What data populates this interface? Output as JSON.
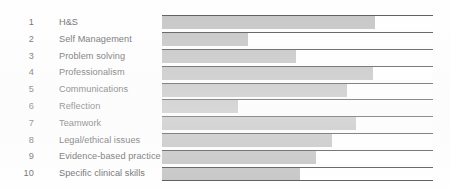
{
  "chart_data": {
    "type": "bar",
    "orientation": "horizontal",
    "title": "",
    "xlabel": "",
    "ylabel": "",
    "grid": false,
    "legend": null,
    "xlim": [
      0,
      100
    ],
    "value_unit": "percent-of-track",
    "categories": [
      "H&S",
      "Self Management",
      "Problem solving",
      "Professionalism",
      "Communications",
      "Reflection",
      "Teamwork",
      "Legal/ethical issues",
      "Evidence-based practice",
      "Specific clinical skills"
    ],
    "row_numbers": [
      "1",
      "2",
      "3",
      "4",
      "5",
      "6",
      "7",
      "8",
      "9",
      "10"
    ],
    "values": [
      78.6,
      31.7,
      49.4,
      77.9,
      68.3,
      28.0,
      71.6,
      62.7,
      56.8,
      50.9
    ],
    "series": [
      {
        "name": "Completion",
        "values": [
          78.6,
          31.7,
          49.4,
          77.9,
          68.3,
          28.0,
          71.6,
          62.7,
          56.8,
          50.9
        ]
      }
    ],
    "colors": {
      "bar_fill": "#c6c6c6",
      "track_fill": "#ffffff",
      "rule": "#5b5b5b",
      "text": "#6f6f6f",
      "background": "#fefefe"
    }
  },
  "rows": [
    {
      "number": "1",
      "label": "H&S"
    },
    {
      "number": "2",
      "label": "Self Management"
    },
    {
      "number": "3",
      "label": "Problem solving"
    },
    {
      "number": "4",
      "label": "Professionalism"
    },
    {
      "number": "5",
      "label": "Communications"
    },
    {
      "number": "6",
      "label": "Reflection"
    },
    {
      "number": "7",
      "label": "Teamwork"
    },
    {
      "number": "8",
      "label": "Legal/ethical issues"
    },
    {
      "number": "9",
      "label": "Evidence-based practice"
    },
    {
      "number": "10",
      "label": "Specific clinical skills"
    }
  ]
}
